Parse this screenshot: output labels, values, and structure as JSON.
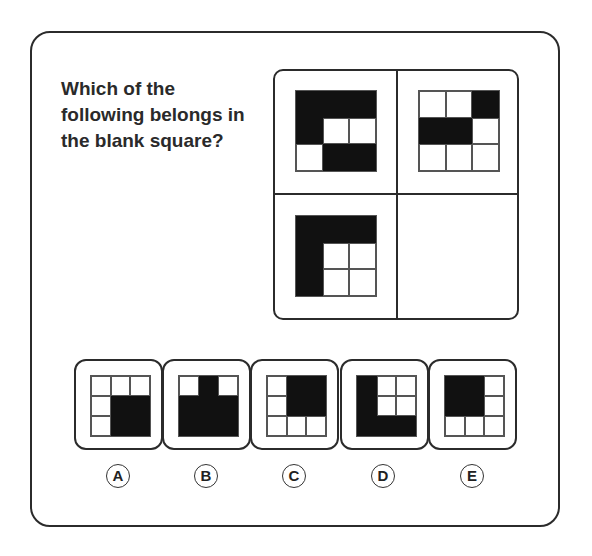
{
  "question": "Which of the following belongs in the blank square?",
  "puzzle": {
    "cells": [
      {
        "position": "top-left",
        "pattern": [
          [
            1,
            1,
            1
          ],
          [
            1,
            0,
            0
          ],
          [
            0,
            1,
            1
          ]
        ]
      },
      {
        "position": "top-right",
        "pattern": [
          [
            0,
            0,
            1
          ],
          [
            1,
            1,
            0
          ],
          [
            0,
            0,
            0
          ]
        ]
      },
      {
        "position": "bottom-left",
        "pattern": [
          [
            1,
            1,
            1
          ],
          [
            1,
            0,
            0
          ],
          [
            1,
            0,
            0
          ]
        ]
      },
      {
        "position": "bottom-right",
        "pattern": null,
        "blank": true
      }
    ]
  },
  "options": [
    {
      "label": "A",
      "pattern": [
        [
          0,
          0,
          0
        ],
        [
          0,
          1,
          1
        ],
        [
          0,
          1,
          1
        ]
      ]
    },
    {
      "label": "B",
      "pattern": [
        [
          0,
          1,
          0
        ],
        [
          1,
          1,
          1
        ],
        [
          1,
          1,
          1
        ]
      ]
    },
    {
      "label": "C",
      "pattern": [
        [
          0,
          1,
          1
        ],
        [
          0,
          1,
          1
        ],
        [
          0,
          0,
          0
        ]
      ]
    },
    {
      "label": "D",
      "pattern": [
        [
          1,
          0,
          0
        ],
        [
          1,
          0,
          0
        ],
        [
          1,
          1,
          1
        ]
      ]
    },
    {
      "label": "E",
      "pattern": [
        [
          1,
          1,
          0
        ],
        [
          1,
          1,
          0
        ],
        [
          0,
          0,
          0
        ]
      ]
    }
  ],
  "colors": {
    "filled": "#111111",
    "empty": "#ffffff",
    "border": "#2b2b2b"
  }
}
